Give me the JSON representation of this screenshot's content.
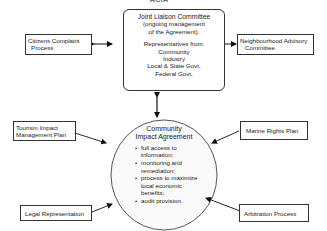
{
  "diagram": {
    "top_label": "ACIA",
    "joint_liaison_committee": {
      "title": "Joint Liaison Committee",
      "subtitle_line1": "(ongoing management",
      "subtitle_line2": "of the Agreement).",
      "reps_heading": "Representatives from:",
      "reps": [
        "Community",
        "Industry",
        "Local & State Govt.",
        "Federal Govt."
      ]
    },
    "citizens_complaint": {
      "line1": "Citizens Complaint",
      "line2": "Process"
    },
    "neighbourhood_advisory": {
      "line1": "Neighbourhood Advisory",
      "line2": "Committee"
    },
    "community_impact_agreement": {
      "title_line1": "Community",
      "title_line2": "Impact Agreement",
      "items": [
        "full access to information;",
        "monitoring and remediation;",
        "process to maximize local economic benefits;",
        "audit provision."
      ],
      "item_lines": [
        [
          "full access to",
          "information;"
        ],
        [
          "monitoring and",
          "remediation;"
        ],
        [
          "process to maximize",
          "local economic",
          "benefits;"
        ],
        [
          "audit provision."
        ]
      ]
    },
    "tourism_impact": {
      "line1": "Tourism Impact",
      "line2": "Management Plan"
    },
    "marine_rights": {
      "label": "Marine Rights Plan"
    },
    "legal_representation": {
      "label": "Legal Representation"
    },
    "arbitration_process": {
      "label": "Arbitration Process"
    },
    "edges": [
      {
        "from": "citizens_complaint",
        "to": "joint_liaison_committee",
        "type": "bidirectional"
      },
      {
        "from": "joint_liaison_committee",
        "to": "neighbourhood_advisory",
        "type": "bidirectional"
      },
      {
        "from": "joint_liaison_committee",
        "to": "community_impact_agreement",
        "type": "bidirectional"
      },
      {
        "from": "tourism_impact",
        "to": "community_impact_agreement",
        "type": "directed"
      },
      {
        "from": "marine_rights",
        "to": "community_impact_agreement",
        "type": "directed"
      },
      {
        "from": "legal_representation",
        "to": "community_impact_agreement",
        "type": "directed"
      },
      {
        "from": "arbitration_process",
        "to": "community_impact_agreement",
        "type": "directed"
      }
    ]
  }
}
